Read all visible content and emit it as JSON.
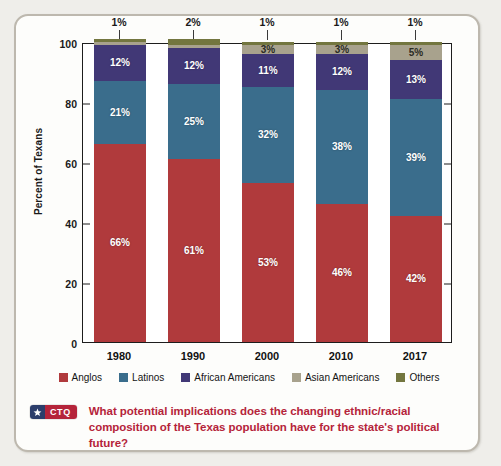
{
  "chart_data": {
    "type": "bar",
    "subtype": "stacked-100-percent",
    "title": "",
    "xlabel": "",
    "ylabel": "Percent of Texans",
    "ylim": [
      0,
      100
    ],
    "yticks": [
      0,
      20,
      40,
      60,
      80,
      100
    ],
    "ytick_labels": [
      "0",
      "20",
      "40",
      "60",
      "80",
      "100"
    ],
    "grid": false,
    "legend_position": "bottom",
    "categories": [
      "1980",
      "1990",
      "2000",
      "2010",
      "2017"
    ],
    "series": [
      {
        "name": "Anglos",
        "color": "#b03a3c",
        "values": [
          66,
          61,
          53,
          46,
          42
        ],
        "labels": [
          "66%",
          "61%",
          "53%",
          "46%",
          "42%"
        ]
      },
      {
        "name": "Latinos",
        "color": "#3a6d8c",
        "values": [
          21,
          25,
          32,
          38,
          39
        ],
        "labels": [
          "21%",
          "25%",
          "32%",
          "38%",
          "39%"
        ]
      },
      {
        "name": "African Americans",
        "color": "#413876",
        "values": [
          12,
          12,
          11,
          12,
          13
        ],
        "labels": [
          "12%",
          "12%",
          "11%",
          "12%",
          "13%"
        ]
      },
      {
        "name": "Asian Americans",
        "color": "#a8a28d",
        "values": [
          1,
          1,
          3,
          3,
          5
        ],
        "labels": [
          "",
          "",
          "3%",
          "3%",
          "5%"
        ]
      },
      {
        "name": "Others",
        "color": "#73763f",
        "values": [
          1,
          2,
          1,
          1,
          1
        ],
        "labels": [
          "",
          "",
          "",
          "",
          ""
        ]
      }
    ],
    "callouts": [
      {
        "category": "1980",
        "series": "Others",
        "label": "1%"
      },
      {
        "category": "1990",
        "series": "Others",
        "label": "2%"
      },
      {
        "category": "2000",
        "series": "Others",
        "label": "1%"
      },
      {
        "category": "2010",
        "series": "Others",
        "label": "1%"
      },
      {
        "category": "2017",
        "series": "Others",
        "label": "1%"
      }
    ]
  },
  "legend": {
    "items": [
      {
        "label": "Anglos",
        "color": "#b03a3c"
      },
      {
        "label": "Latinos",
        "color": "#3a6d8c"
      },
      {
        "label": "African Americans",
        "color": "#413876"
      },
      {
        "label": "Asian Americans",
        "color": "#a8a28d"
      },
      {
        "label": "Others",
        "color": "#73763f"
      }
    ]
  },
  "ctq": {
    "abbr": "CTQ",
    "star_icon": "star-icon",
    "question": "What potential implications does the changing ethnic/racial composition of the Texas population have for the state's political future?",
    "accent_color": "#b5243a",
    "badge_navy": "#2c3e6b"
  }
}
